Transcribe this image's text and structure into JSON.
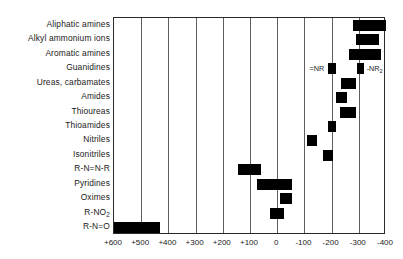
{
  "chart_data": {
    "type": "bar",
    "orientation": "horizontal-range",
    "title": "",
    "subtitle": "",
    "xlabel": "",
    "ylabel": "",
    "xlim": [
      600,
      -400
    ],
    "axis_direction": "decreasing-left-to-right",
    "grid": true,
    "gridlines": [
      600,
      500,
      400,
      300,
      200,
      100,
      0,
      -100,
      -200,
      -300,
      -400
    ],
    "xticks": [
      600,
      500,
      400,
      300,
      200,
      100,
      0,
      -100,
      -200,
      -300,
      -400
    ],
    "xtick_labels": [
      "+600",
      "+500",
      "+400",
      "+300",
      "+200",
      "+100",
      "0",
      "-100",
      "-200",
      "-300",
      "-400"
    ],
    "legend": null,
    "legend_position": "none",
    "categories": [
      "Aliphatic amines",
      "Alkyl ammonium ions",
      "Aromatic amines",
      "Guanidines",
      "Ureas, carbamates",
      "Amides",
      "Thioureas",
      "Thioamides",
      "Nitriles",
      "Isonitriles",
      "R-N=N-R",
      "Pyridines",
      "Oximes",
      "R-NO2",
      "R-N=O"
    ],
    "series": [
      {
        "name": "range",
        "ranges": [
          {
            "category": "Aliphatic amines",
            "start": -280,
            "end": -400,
            "annotation": null
          },
          {
            "category": "Alkyl ammonium ions",
            "start": -290,
            "end": -375,
            "annotation": null
          },
          {
            "category": "Aromatic amines",
            "start": -265,
            "end": -380,
            "annotation": null
          },
          {
            "category": "Guanidines",
            "start": -185,
            "end": -215,
            "annotation": "=NR"
          },
          {
            "category": "Ureas, carbamates",
            "start": -235,
            "end": -290,
            "annotation": null
          },
          {
            "category": "Amides",
            "start": -215,
            "end": -255,
            "annotation": null
          },
          {
            "category": "Thioureas",
            "start": -230,
            "end": -290,
            "annotation": null
          },
          {
            "category": "Thioamides",
            "start": -185,
            "end": -215,
            "annotation": null
          },
          {
            "category": "Nitriles",
            "start": -110,
            "end": -145,
            "annotation": null
          },
          {
            "category": "Isonitriles",
            "start": -170,
            "end": -205,
            "annotation": null
          },
          {
            "category": "R-N=N-R",
            "start": 145,
            "end": 60,
            "annotation": null
          },
          {
            "category": "Pyridines",
            "start": 75,
            "end": -55,
            "annotation": null
          },
          {
            "category": "Oximes",
            "start": -10,
            "end": -55,
            "annotation": null
          },
          {
            "category": "R-NO2",
            "start": 25,
            "end": -25,
            "annotation": null
          },
          {
            "category": "R-N=O",
            "start": 600,
            "end": 430,
            "annotation": null
          }
        ]
      },
      {
        "name": "secondary",
        "ranges": [
          {
            "category": "Guanidines",
            "start": -295,
            "end": -320,
            "annotation": "-NR2"
          }
        ]
      }
    ],
    "annotations": [
      {
        "text": "=NR",
        "category": "Guanidines",
        "value": -200,
        "placement": "left"
      },
      {
        "text": "-NR2",
        "category": "Guanidines",
        "value": -307,
        "placement": "right"
      }
    ]
  },
  "labels": {
    "rows": [
      {
        "text": "Aliphatic amines"
      },
      {
        "text": "Alkyl ammonium ions"
      },
      {
        "text": "Aromatic amines"
      },
      {
        "text": "Guanidines"
      },
      {
        "text": "Ureas, carbamates"
      },
      {
        "text": "Amides"
      },
      {
        "text": "Thioureas"
      },
      {
        "text": "Thioamides"
      },
      {
        "text": "Nitriles"
      },
      {
        "text": "Isonitriles"
      },
      {
        "text": "R-N=N-R"
      },
      {
        "text": "Pyridines"
      },
      {
        "text": "Oximes"
      },
      {
        "text": "R-NO",
        "sub": "2"
      },
      {
        "text": "R-N=O"
      }
    ],
    "xticks": [
      "+600",
      "+500",
      "+400",
      "+300",
      "+200",
      "+100",
      "0",
      "-100",
      "-200",
      "-300",
      "-400"
    ],
    "annotations": [
      {
        "text": "=NR",
        "sub": ""
      },
      {
        "text": "-NR",
        "sub": "2"
      }
    ]
  },
  "colors": {
    "bar": "#000000",
    "frame": "#2b2b2b",
    "grid": "#5e5e5e",
    "text": "#1a1a1a",
    "background": "#ffffff"
  }
}
